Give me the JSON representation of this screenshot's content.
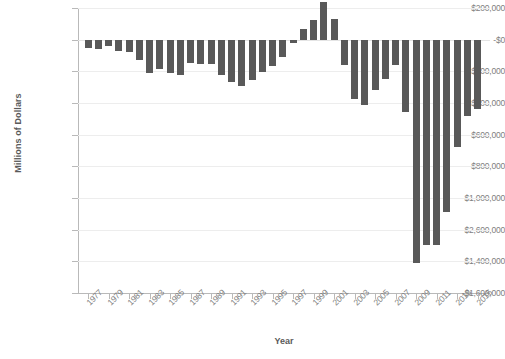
{
  "chart_data": {
    "type": "bar",
    "title": "",
    "xlabel": "Year",
    "ylabel": "Millions of Dollars",
    "ylim": [
      -1600000,
      200000
    ],
    "grid": true,
    "legend": false,
    "y_ticks": [
      200000,
      0,
      -200000,
      -400000,
      -600000,
      -800000,
      -1000000,
      -1200000,
      -1400000,
      -1600000
    ],
    "y_tick_labels": [
      "$200,000",
      "-$0",
      "-$200,000",
      "-$400,000",
      "-$600,000",
      "-$800,000",
      "-$1,000,000",
      "-$2,600,000",
      "-$1,400,000",
      "-$1,600,000"
    ],
    "x_tick_labels": [
      "1977",
      "1979",
      "1981",
      "1983",
      "1985",
      "1987",
      "1989",
      "1991",
      "1993",
      "1995",
      "1997",
      "1999",
      "2001",
      "2003",
      "2005",
      "2007",
      "2009",
      "2011",
      "2013",
      "2015"
    ],
    "categories": [
      "1977",
      "1978",
      "1979",
      "1980",
      "1981",
      "1982",
      "1983",
      "1984",
      "1985",
      "1986",
      "1987",
      "1988",
      "1989",
      "1990",
      "1991",
      "1992",
      "1993",
      "1994",
      "1995",
      "1996",
      "1997",
      "1998",
      "1999",
      "2000",
      "2001",
      "2002",
      "2003",
      "2004",
      "2005",
      "2006",
      "2007",
      "2008",
      "2009",
      "2010",
      "2011",
      "2012",
      "2013",
      "2014",
      "2015"
    ],
    "values": [
      -53659,
      -59186,
      -40726,
      -73830,
      -78968,
      -127977,
      -207802,
      -185367,
      -212308,
      -221227,
      -149730,
      -155178,
      -152639,
      -221036,
      -269238,
      -290321,
      -255051,
      -203186,
      -163952,
      -107431,
      -21884,
      69270,
      125610,
      236241,
      128236,
      -157758,
      -377585,
      -412727,
      -318346,
      -248181,
      -160701,
      -458553,
      -1412688,
      -1294373,
      -1299593,
      -1086957,
      -679500,
      -484600,
      -438900
    ],
    "bar_color": "#595959",
    "series_name": "Federal Surplus or Deficit"
  }
}
